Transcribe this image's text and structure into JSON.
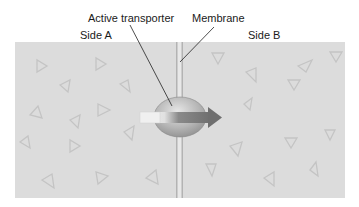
{
  "labels": {
    "active_transporter": "Active transporter",
    "membrane": "Membrane",
    "side_a": "Side A",
    "side_b": "Side B"
  },
  "colors": {
    "panel": "#dcdcdc",
    "membrane": "#8a8a8a",
    "transporter": "#b8b8b8",
    "arrow": "#7a7a7a",
    "arrow_tail": "#f2f2f2",
    "particle": "#c4c4c4"
  },
  "particles": {
    "side_a_count": 13,
    "side_b_count": 12,
    "shape": "triangle"
  }
}
